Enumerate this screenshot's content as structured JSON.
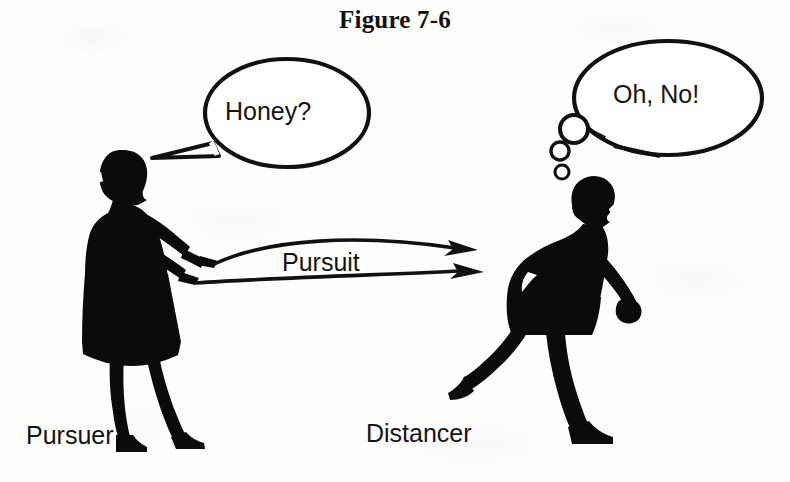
{
  "figure": {
    "title": "Figure 7-6",
    "caption_left": "Pursuer",
    "caption_right": "Distancer",
    "relation_label": "Pursuit"
  },
  "speech": {
    "pursuer_bubble": "Honey?",
    "distancer_bubble": "Oh, No!"
  },
  "icons": {
    "speech_bubble": "speech-bubble-icon",
    "thought_bubble": "thought-bubble-icon",
    "pursuit_arrow": "arrow-right-icon",
    "woman_silhouette": "woman-silhouette-icon",
    "man_silhouette": "man-silhouette-icon"
  },
  "colors": {
    "ink": "#111111",
    "paper": "#fdfdfc",
    "silhouette": "#0b0b0b"
  }
}
